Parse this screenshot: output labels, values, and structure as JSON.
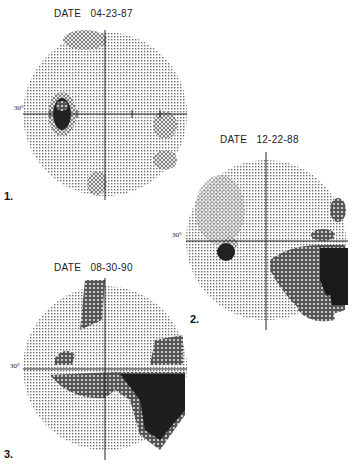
{
  "figure": {
    "type": "visual field grayscale plots (Humphrey perimetry)",
    "panels": [
      {
        "label": "1.",
        "date_label": "DATE",
        "date": "04-23-87",
        "axis_label": "30°",
        "defects": [
          {
            "region": "left of center, near horizontal meridian",
            "severity": "dense"
          }
        ]
      },
      {
        "label": "2.",
        "date_label": "DATE",
        "date": "12-22-88",
        "axis_label": "30°",
        "defects": [
          {
            "region": "left blind-spot area",
            "severity": "dense"
          },
          {
            "region": "inferior right / nasal quadrant",
            "severity": "dense to absolute"
          }
        ]
      },
      {
        "label": "3.",
        "date_label": "DATE",
        "date": "08-30-90",
        "axis_label": "30°",
        "defects": [
          {
            "region": "superior arc above center",
            "severity": "dense"
          },
          {
            "region": "inferior arcuate + inferior right quadrant",
            "severity": "absolute"
          }
        ]
      }
    ]
  },
  "colors": {
    "light": "#bdbdbd",
    "mid": "#8a8a8a",
    "dark": "#3a3a3a",
    "black": "#111111"
  }
}
